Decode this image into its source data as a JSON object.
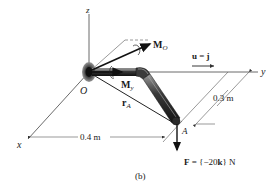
{
  "figure": {
    "caption": "(b)",
    "axes": {
      "x_label": "x",
      "y_label": "y",
      "z_label": "z",
      "origin_label": "O"
    },
    "point_label": "A",
    "vectors": {
      "moment_O": {
        "symbol": "M",
        "subscript": "O"
      },
      "moment_y": {
        "symbol": "M",
        "subscript": "y"
      },
      "position": {
        "symbol": "r",
        "subscript": "A"
      },
      "unit": {
        "text_bold": "u",
        "equals": " = ",
        "value_bold": "j"
      },
      "force": {
        "prefix_bold": "F",
        "eq_open": " = {−20",
        "k": "k",
        "close": "} N"
      }
    },
    "dimensions": {
      "x_offset": "0.4 m",
      "y_offset": "0.3 m"
    },
    "colors": {
      "line": "#333333",
      "pipe_dark": "#2a2a2a",
      "pipe_highlight": "#8a8a8a",
      "support": "#6e6e6e"
    }
  }
}
